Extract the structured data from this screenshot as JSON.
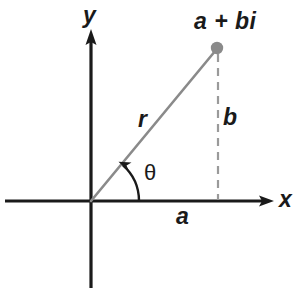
{
  "figure": {
    "type": "diagram",
    "background_color": "#ffffff",
    "axis_color": "#1a1a1a",
    "ray_color": "#8a8a8a",
    "dashed_color": "#9a9a9a",
    "point_color": "#8a8a8a",
    "text_color": "#1a1a1a"
  },
  "axes": {
    "origin": {
      "x": 91,
      "y": 201
    },
    "x_axis": {
      "label": "x",
      "start_x": 5,
      "end_x": 274,
      "y": 201,
      "arrow": "right"
    },
    "y_axis": {
      "label": "y",
      "x": 91,
      "top_y": 33,
      "bottom_y": 288,
      "arrow": "up"
    }
  },
  "point": {
    "label": "a + bi",
    "x": 217,
    "y": 48,
    "radius": 6
  },
  "segments": {
    "radius": {
      "label": "r",
      "from": "origin",
      "to": "point"
    },
    "vertical_leg": {
      "label": "b",
      "style": "dashed",
      "from_x": 218,
      "from_y": 54,
      "to_y": 201
    },
    "horizontal_leg": {
      "label": "a",
      "from_x": 91,
      "to_x": 218,
      "y": 201
    }
  },
  "angle": {
    "label": "θ",
    "vertex": "origin",
    "from": "positive-x-axis",
    "to": "radius",
    "degrees": 50.6,
    "arrow": "counterclockwise"
  },
  "labels": {
    "y_axis": "y",
    "x_axis": "x",
    "point": "a + bi",
    "radius": "r",
    "imaginary_part": "b",
    "real_part": "a",
    "angle": "θ"
  }
}
